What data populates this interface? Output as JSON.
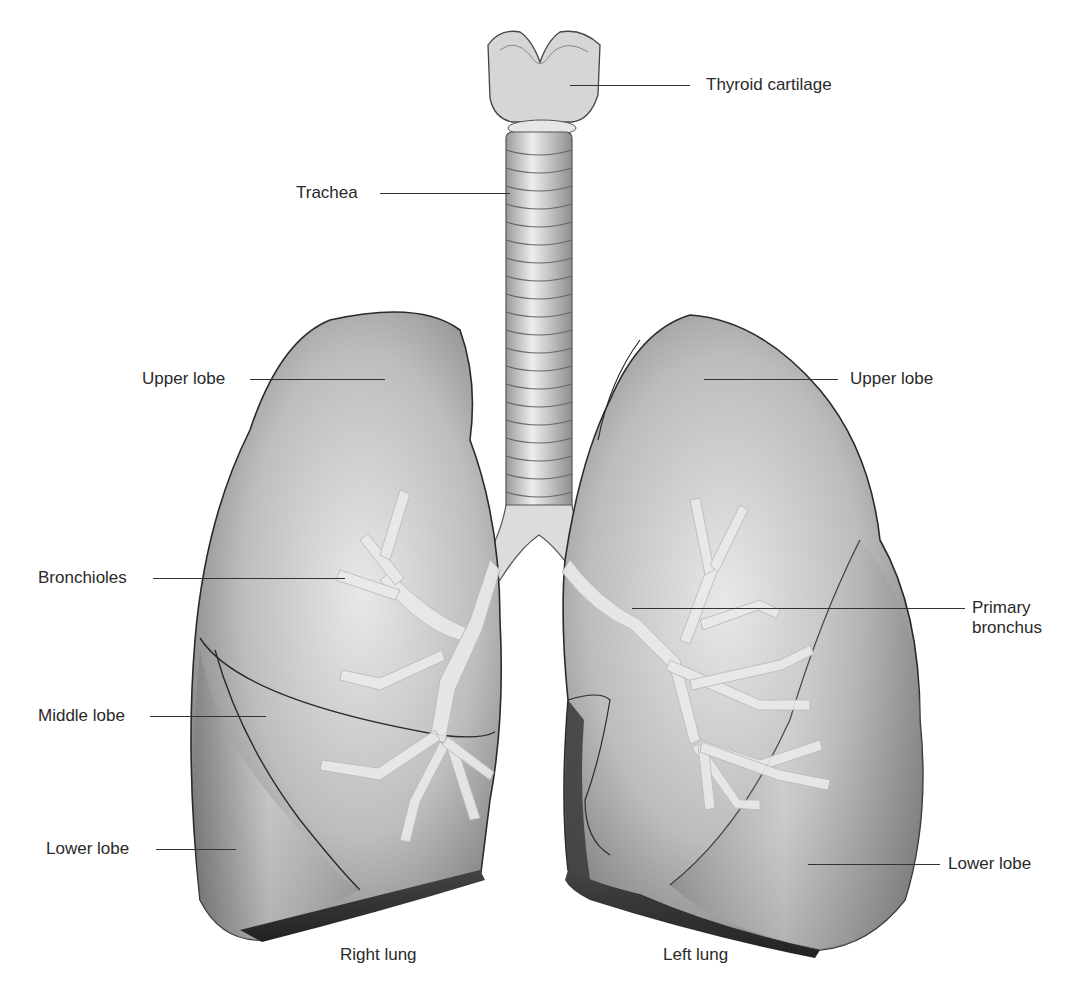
{
  "labels": {
    "thyroid_cartilage": "Thyroid cartilage",
    "trachea": "Trachea",
    "right_upper_lobe": "Upper lobe",
    "left_upper_lobe": "Upper lobe",
    "bronchioles": "Bronchioles",
    "primary_bronchus_line1": "Primary",
    "primary_bronchus_line2": "bronchus",
    "middle_lobe": "Middle lobe",
    "right_lower_lobe": "Lower lobe",
    "left_lower_lobe": "Lower lobe",
    "right_lung": "Right lung",
    "left_lung": "Left lung"
  },
  "colors": {
    "background": "#ffffff",
    "lung_light": "#e2e2e2",
    "lung_mid": "#a8a8a8",
    "lung_dark": "#555555",
    "outline": "#2a2a2a",
    "airway": "#ececec",
    "text": "#2a2a2a"
  }
}
